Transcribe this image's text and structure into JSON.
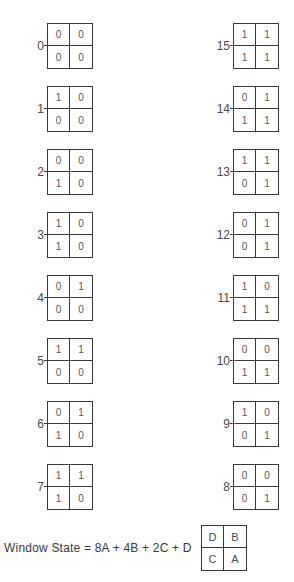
{
  "diagram": {
    "left_column": [
      {
        "state": "0",
        "cells": [
          "0",
          "0",
          "0",
          "0"
        ]
      },
      {
        "state": "1",
        "cells": [
          "1",
          "0",
          "0",
          "0"
        ]
      },
      {
        "state": "2",
        "cells": [
          "0",
          "0",
          "1",
          "0"
        ]
      },
      {
        "state": "3",
        "cells": [
          "1",
          "0",
          "1",
          "0"
        ]
      },
      {
        "state": "4",
        "cells": [
          "0",
          "1",
          "0",
          "0"
        ]
      },
      {
        "state": "5",
        "cells": [
          "1",
          "1",
          "0",
          "0"
        ]
      },
      {
        "state": "6",
        "cells": [
          "0",
          "1",
          "1",
          "0"
        ]
      },
      {
        "state": "7",
        "cells": [
          "1",
          "1",
          "1",
          "0"
        ]
      }
    ],
    "right_column": [
      {
        "state": "15",
        "cells": [
          "1",
          "1",
          "1",
          "1"
        ]
      },
      {
        "state": "14",
        "cells": [
          "0",
          "1",
          "1",
          "1"
        ]
      },
      {
        "state": "13",
        "cells": [
          "1",
          "1",
          "0",
          "1"
        ]
      },
      {
        "state": "12",
        "cells": [
          "0",
          "1",
          "0",
          "1"
        ]
      },
      {
        "state": "11",
        "cells": [
          "1",
          "0",
          "1",
          "1"
        ]
      },
      {
        "state": "10",
        "cells": [
          "0",
          "0",
          "1",
          "1"
        ]
      },
      {
        "state": "9",
        "cells": [
          "1",
          "0",
          "0",
          "1"
        ]
      },
      {
        "state": "8",
        "cells": [
          "0",
          "0",
          "0",
          "1"
        ]
      }
    ],
    "formula": "Window State = 8A + 4B + 2C + D",
    "legend": {
      "cells": [
        "D",
        "B",
        "C",
        "A"
      ]
    }
  }
}
